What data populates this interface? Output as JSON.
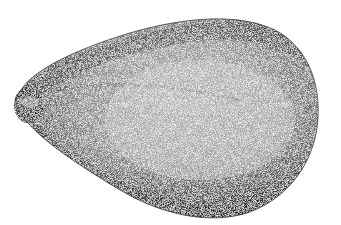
{
  "image": {
    "subject": "stipple illustration of a seed",
    "style": "black ink stippling on white",
    "colors": {
      "background": "#ffffff",
      "ink_dark": "#2a2a2a",
      "ink_mid": "#6e6e6e",
      "ink_light": "#a8a8a8"
    }
  }
}
